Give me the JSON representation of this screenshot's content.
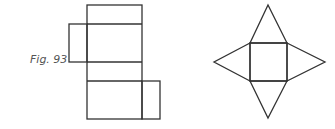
{
  "figure": {
    "caption": "Fig. 93",
    "nets": [
      {
        "name": "cuboid-net",
        "description": "Net of a rectangular prism: four stacked rectangles with side flaps"
      },
      {
        "name": "square-pyramid-net",
        "description": "Net of a square-based pyramid: square with four triangles"
      }
    ]
  }
}
